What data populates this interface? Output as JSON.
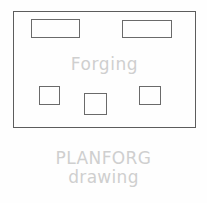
{
  "drawing": {
    "title_label": "Forging",
    "frame": {
      "name": "plan-outline",
      "stroke_color": "#5d5d5d"
    },
    "features": [
      {
        "id": "top-left-pocket",
        "shape": "rectangle",
        "stroke_color": "#6a6a6a"
      },
      {
        "id": "top-right-pocket",
        "shape": "rectangle",
        "stroke_color": "#6a6a6a"
      },
      {
        "id": "bottom-left-boss",
        "shape": "square",
        "stroke_color": "#6a6a6a"
      },
      {
        "id": "bottom-center-boss",
        "shape": "square",
        "stroke_color": "#6a6a6a"
      },
      {
        "id": "bottom-right-boss",
        "shape": "square",
        "stroke_color": "#6a6a6a"
      }
    ]
  },
  "caption": {
    "line1": "PLANFORG",
    "line2": "drawing",
    "text_color": "#cfcfcf"
  },
  "colors": {
    "background": "#fefefe",
    "line": "#5d5d5d",
    "text_muted": "#cfcfcf"
  }
}
